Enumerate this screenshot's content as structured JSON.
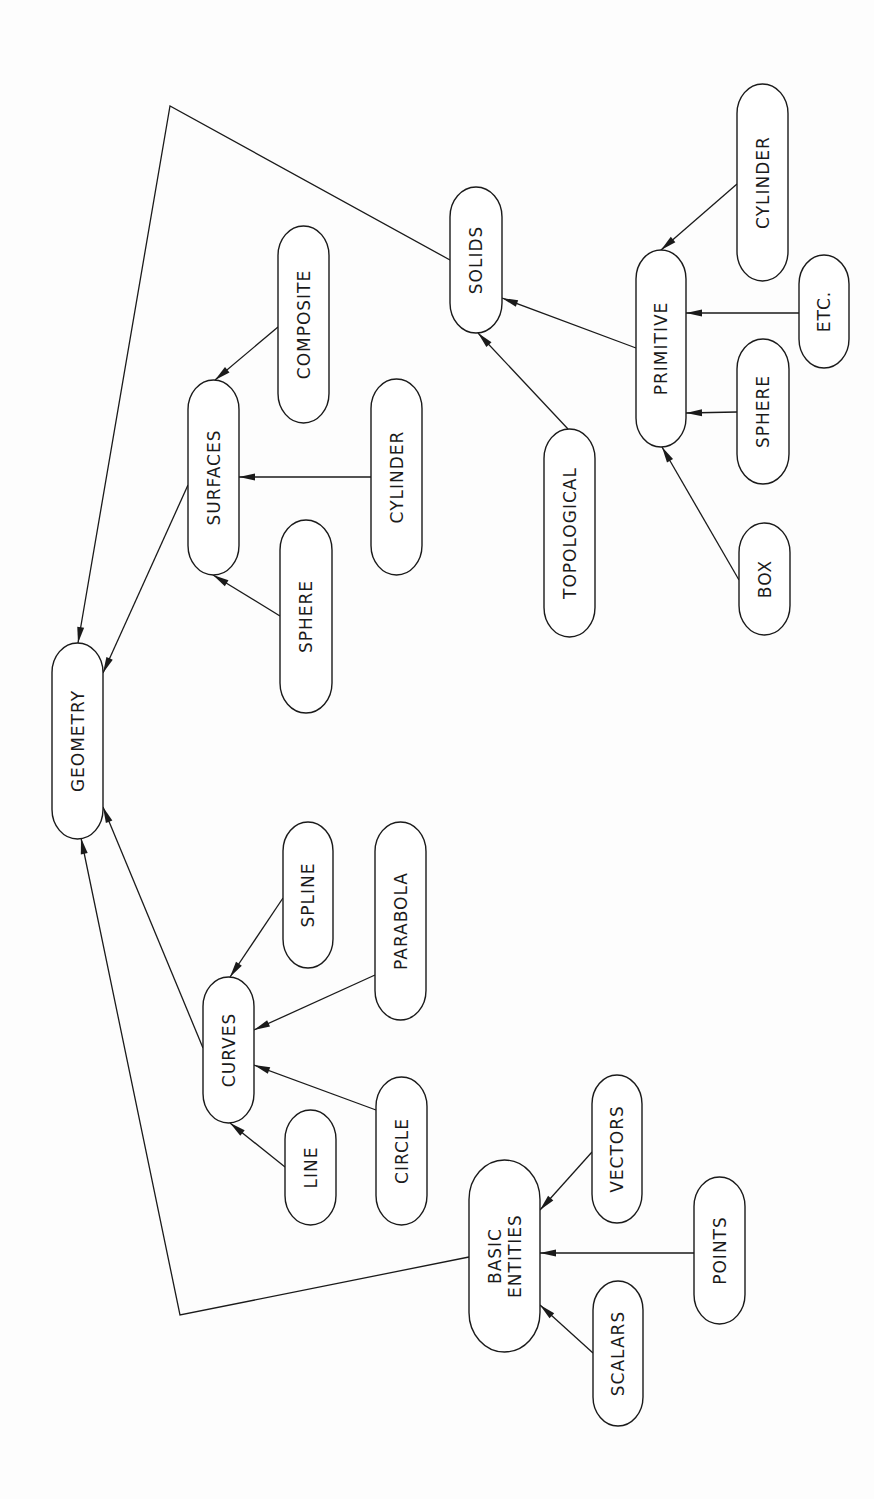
{
  "diagram": {
    "title": "",
    "orientation": "rotated-90-ccw",
    "colors": {
      "background": "#fdfdfd",
      "stroke": "#1a1a1a",
      "node_fill": "#ffffff"
    },
    "nodes": [
      {
        "id": "geometry",
        "label": "GEOMETRY",
        "x": 52,
        "y": 643,
        "w": 51,
        "h": 196
      },
      {
        "id": "surfaces",
        "label": "SURFACES",
        "x": 188,
        "y": 380,
        "w": 51,
        "h": 195
      },
      {
        "id": "composite",
        "label": "COMPOSITE",
        "x": 278,
        "y": 226,
        "w": 51,
        "h": 197
      },
      {
        "id": "cylinder_surf",
        "label": "CYLINDER",
        "x": 371,
        "y": 379,
        "w": 51,
        "h": 196
      },
      {
        "id": "sphere_surf",
        "label": "SPHERE",
        "x": 280,
        "y": 520,
        "w": 52,
        "h": 193
      },
      {
        "id": "solids",
        "label": "SOLIDS",
        "x": 450,
        "y": 187,
        "w": 52,
        "h": 146
      },
      {
        "id": "topological",
        "label": "TOPOLOGICAL",
        "x": 544,
        "y": 429,
        "w": 51,
        "h": 208
      },
      {
        "id": "primitive",
        "label": "PRIMITIVE",
        "x": 636,
        "y": 250,
        "w": 50,
        "h": 197
      },
      {
        "id": "cylinder_prim",
        "label": "CYLINDER",
        "x": 737,
        "y": 84,
        "w": 51,
        "h": 197
      },
      {
        "id": "etc",
        "label": "ETC.",
        "x": 799,
        "y": 255,
        "w": 50,
        "h": 113
      },
      {
        "id": "sphere_prim",
        "label": "SPHERE",
        "x": 737,
        "y": 339,
        "w": 52,
        "h": 145
      },
      {
        "id": "box",
        "label": "BOX",
        "x": 739,
        "y": 523,
        "w": 51,
        "h": 112
      },
      {
        "id": "curves",
        "label": "CURVES",
        "x": 203,
        "y": 977,
        "w": 51,
        "h": 146
      },
      {
        "id": "spline",
        "label": "SPLINE",
        "x": 283,
        "y": 822,
        "w": 50,
        "h": 146
      },
      {
        "id": "parabola",
        "label": "PARABOLA",
        "x": 375,
        "y": 822,
        "w": 51,
        "h": 198
      },
      {
        "id": "line",
        "label": "LINE",
        "x": 285,
        "y": 1110,
        "w": 51,
        "h": 115
      },
      {
        "id": "circle",
        "label": "CIRCLE",
        "x": 376,
        "y": 1077,
        "w": 51,
        "h": 148
      },
      {
        "id": "basic_entities",
        "label": "BASIC ENTITIES",
        "label_lines": [
          "BASIC",
          "ENTITIES"
        ],
        "x": 469,
        "y": 1160,
        "w": 71,
        "h": 192
      },
      {
        "id": "vectors",
        "label": "VECTORS",
        "x": 592,
        "y": 1075,
        "w": 50,
        "h": 148
      },
      {
        "id": "points",
        "label": "POINTS",
        "x": 694,
        "y": 1177,
        "w": 51,
        "h": 147
      },
      {
        "id": "scalars",
        "label": "SCALARS",
        "x": 593,
        "y": 1281,
        "w": 50,
        "h": 145
      }
    ],
    "edges": [
      {
        "from": "solids",
        "to": "geometry",
        "points": [
          [
            450,
            260
          ],
          [
            170,
            106
          ],
          [
            78,
            643
          ]
        ],
        "arrow": true
      },
      {
        "from": "surfaces",
        "to": "geometry",
        "points": [
          [
            188,
            485
          ],
          [
            103,
            673
          ]
        ],
        "arrow": true
      },
      {
        "from": "curves",
        "to": "geometry",
        "points": [
          [
            203,
            1048
          ],
          [
            103,
            807
          ]
        ],
        "arrow": true
      },
      {
        "from": "basic_entities",
        "to": "geometry",
        "points": [
          [
            469,
            1257
          ],
          [
            180,
            1315
          ],
          [
            81,
            838
          ]
        ],
        "arrow": true
      },
      {
        "from": "composite",
        "to": "surfaces",
        "points": [
          [
            278,
            327
          ],
          [
            215,
            380
          ]
        ],
        "arrow": true
      },
      {
        "from": "cylinder_surf",
        "to": "surfaces",
        "points": [
          [
            371,
            477
          ],
          [
            239,
            477
          ]
        ],
        "arrow": true
      },
      {
        "from": "sphere_surf",
        "to": "surfaces",
        "points": [
          [
            280,
            616
          ],
          [
            213,
            575
          ]
        ],
        "arrow": true
      },
      {
        "from": "primitive",
        "to": "solids",
        "points": [
          [
            636,
            348
          ],
          [
            502,
            298
          ]
        ],
        "arrow": true
      },
      {
        "from": "topological",
        "to": "solids",
        "points": [
          [
            568,
            429
          ],
          [
            478,
            333
          ]
        ],
        "arrow": true
      },
      {
        "from": "cylinder_prim",
        "to": "primitive",
        "points": [
          [
            737,
            184
          ],
          [
            661,
            250
          ]
        ],
        "arrow": true
      },
      {
        "from": "etc",
        "to": "primitive",
        "points": [
          [
            799,
            313
          ],
          [
            686,
            313
          ]
        ],
        "arrow": true
      },
      {
        "from": "sphere_prim",
        "to": "primitive",
        "points": [
          [
            737,
            412
          ],
          [
            686,
            413
          ]
        ],
        "arrow": true
      },
      {
        "from": "box",
        "to": "primitive",
        "points": [
          [
            739,
            580
          ],
          [
            662,
            447
          ]
        ],
        "arrow": true
      },
      {
        "from": "spline",
        "to": "curves",
        "points": [
          [
            283,
            898
          ],
          [
            230,
            977
          ]
        ],
        "arrow": true
      },
      {
        "from": "parabola",
        "to": "curves",
        "points": [
          [
            375,
            975
          ],
          [
            254,
            1030
          ]
        ],
        "arrow": true
      },
      {
        "from": "circle",
        "to": "curves",
        "points": [
          [
            376,
            1110
          ],
          [
            254,
            1065
          ]
        ],
        "arrow": true
      },
      {
        "from": "line",
        "to": "curves",
        "points": [
          [
            285,
            1167
          ],
          [
            230,
            1123
          ]
        ],
        "arrow": true
      },
      {
        "from": "vectors",
        "to": "basic_entities",
        "points": [
          [
            592,
            1152
          ],
          [
            540,
            1210
          ]
        ],
        "arrow": true
      },
      {
        "from": "points",
        "to": "basic_entities",
        "points": [
          [
            694,
            1253
          ],
          [
            540,
            1253
          ]
        ],
        "arrow": true
      },
      {
        "from": "scalars",
        "to": "basic_entities",
        "points": [
          [
            593,
            1353
          ],
          [
            540,
            1305
          ]
        ],
        "arrow": true
      }
    ]
  }
}
